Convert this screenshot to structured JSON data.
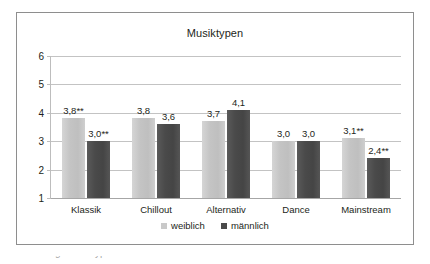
{
  "chart_data": {
    "type": "bar",
    "title": "Musiktypen",
    "xlabel": "",
    "ylabel": "",
    "ylim": [
      1,
      6
    ],
    "yticks": [
      1,
      2,
      3,
      4,
      5,
      6
    ],
    "grid": true,
    "legend_position": "bottom",
    "categories": [
      "Klassik",
      "Chillout",
      "Alternativ",
      "Dance",
      "Mainstream"
    ],
    "series": [
      {
        "name": "weiblich",
        "color": "#c9c9c9",
        "values": [
          3.8,
          3.8,
          3.7,
          3.0,
          3.1
        ],
        "labels": [
          "3,8**",
          "3,8",
          "3,7",
          "3,0",
          "3,1**"
        ]
      },
      {
        "name": "männlich",
        "color": "#4a4a4a",
        "values": [
          3.0,
          3.6,
          4.1,
          3.0,
          2.4
        ],
        "labels": [
          "3,0**",
          "3,6",
          "4,1",
          "3,0",
          "2,4**"
        ]
      }
    ]
  },
  "caption": {
    "cut_off_text": "Abbildung: Musiktypen nach Geschlecht"
  }
}
